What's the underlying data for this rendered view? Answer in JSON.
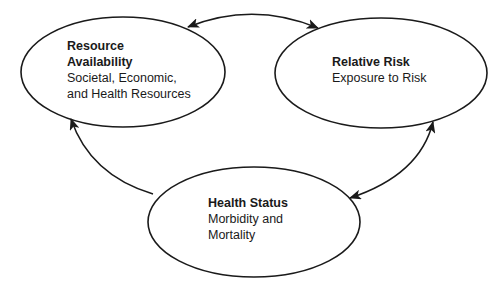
{
  "diagram": {
    "nodes": [
      {
        "id": "resource-availability",
        "title_line1": "Resource",
        "title_line2": "Availability",
        "sub_line1": "Societal, Economic,",
        "sub_line2": "and Health Resources"
      },
      {
        "id": "relative-risk",
        "title": "Relative Risk",
        "sub_line1": "Exposure to Risk"
      },
      {
        "id": "health-status",
        "title": "Health Status",
        "sub_line1": "Morbidity and",
        "sub_line2": "Mortality"
      }
    ],
    "edges": [
      {
        "from": "resource-availability",
        "to": "relative-risk",
        "direction": "bidirectional"
      },
      {
        "from": "relative-risk",
        "to": "health-status",
        "direction": "bidirectional"
      },
      {
        "from": "health-status",
        "to": "resource-availability",
        "direction": "one-way"
      }
    ],
    "colors": {
      "stroke": "#1a1a1a",
      "background": "#ffffff"
    }
  }
}
